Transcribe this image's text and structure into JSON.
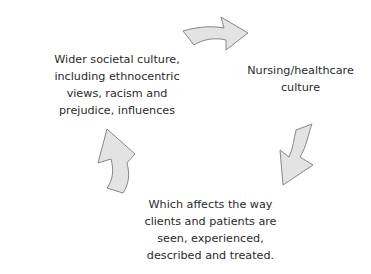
{
  "diagram": {
    "type": "cycle",
    "nodes": [
      {
        "id": "societal",
        "lines": [
          "Wider societal culture,",
          "including ethnocentric",
          "views, racism and",
          "prejudice, influences"
        ]
      },
      {
        "id": "nursing",
        "lines": [
          "Nursing/healthcare",
          "culture"
        ]
      },
      {
        "id": "affects",
        "lines": [
          "Which affects the way",
          "clients and patients are",
          "seen, experienced,",
          "described and treated."
        ]
      }
    ],
    "edges": [
      {
        "from": "societal",
        "to": "nursing",
        "arrow": "curved-right-arrow"
      },
      {
        "from": "nursing",
        "to": "affects",
        "arrow": "curved-down-left-arrow"
      },
      {
        "from": "affects",
        "to": "societal",
        "arrow": "curved-up-arrow"
      }
    ],
    "colors": {
      "arrow_fill": "#e3e3e3",
      "arrow_stroke": "#7a7a7a",
      "text": "#2a2a2a",
      "background": "#ffffff"
    }
  }
}
